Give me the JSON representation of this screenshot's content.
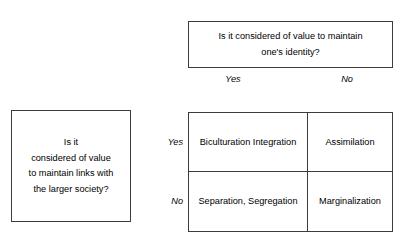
{
  "figure": {
    "clipped_top_line": "",
    "top_question": {
      "line1": "Is it considered of value to maintain",
      "line2": "one's identity?"
    },
    "column_headers": {
      "yes": "Yes",
      "no": "No"
    },
    "left_question": {
      "line1": "Is it",
      "line2": "considered of value",
      "line3": "to maintain links with",
      "line4": "the larger society?"
    },
    "row_headers": {
      "yes": "Yes",
      "no": "No"
    },
    "matrix": {
      "yes_yes": "Biculturation Integration",
      "yes_no": "Assimilation",
      "no_yes": "Separation, Segregation",
      "no_no": "Marginalization"
    }
  },
  "chart_data": {
    "type": "table",
    "row_axis_label": "Is it considered of value to maintain links with the larger society?",
    "column_axis_label": "Is it considered of value to maintain one's identity?",
    "columns": [
      "Yes",
      "No"
    ],
    "rows": [
      "Yes",
      "No"
    ],
    "cells": [
      [
        "Biculturation Integration",
        "Assimilation"
      ],
      [
        "Separation, Segregation",
        "Marginalization"
      ]
    ],
    "grid": true,
    "legend": "none"
  }
}
